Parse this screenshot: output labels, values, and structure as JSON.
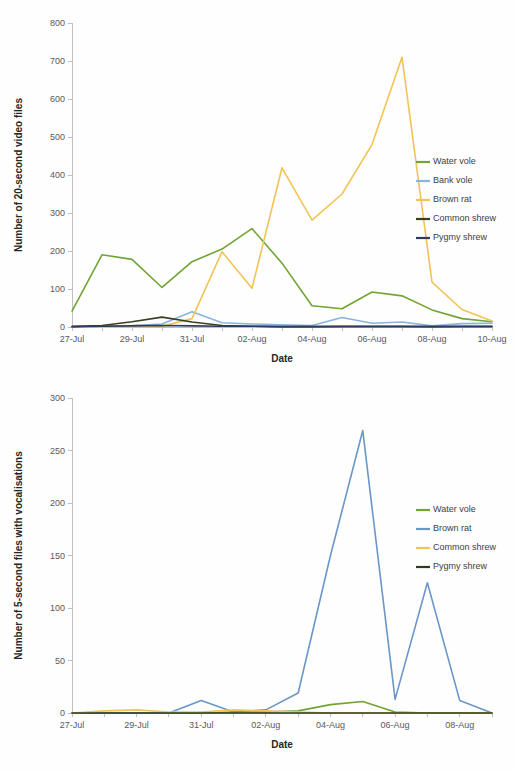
{
  "figure": {
    "title": "",
    "background": "#fefefe"
  },
  "palette": {
    "water_vole": "#70A433",
    "bank_vole": "#89B4DE",
    "brown_rat_gold": "#F2C357",
    "common_shrew_dark": "#3A3F1C",
    "pygmy_shrew_navy": "#2F3B5C",
    "brown_rat_blue": "#6A96C8",
    "common_shrew_gold": "#F2C357",
    "pygmy_shrew_dark": "#2E3B20",
    "axis": "#bfbfbf",
    "text": "#404040"
  },
  "chart_data": [
    {
      "id": "video-files-chart",
      "type": "line",
      "title": "",
      "xlabel": "Date",
      "ylabel": "Number of 20-second video files",
      "ylim": [
        0,
        800
      ],
      "yticks": [
        0,
        100,
        200,
        300,
        400,
        500,
        600,
        700,
        800
      ],
      "ytick_labels": [
        "0",
        "100",
        "200",
        "300",
        "400",
        "500",
        "600",
        "700",
        "800"
      ],
      "grid": false,
      "legend_position": "right",
      "x": [
        "27-Jul",
        "28-Jul",
        "29-Jul",
        "30-Jul",
        "31-Jul",
        "01-Aug",
        "02-Aug",
        "03-Aug",
        "04-Aug",
        "05-Aug",
        "06-Aug",
        "07-Aug",
        "08-Aug",
        "09-Aug",
        "10-Aug"
      ],
      "xtick_labels": [
        "27-Jul",
        "",
        "29-Jul",
        "",
        "31-Jul",
        "",
        "02-Aug",
        "",
        "04-Aug",
        "",
        "06-Aug",
        "",
        "08-Aug",
        "",
        "10-Aug"
      ],
      "series": [
        {
          "name": "Water vole",
          "color_key": "water_vole",
          "values": [
            42,
            190,
            178,
            104,
            172,
            205,
            259,
            168,
            56,
            48,
            92,
            82,
            45,
            22,
            14
          ]
        },
        {
          "name": "Bank vole",
          "color_key": "bank_vole",
          "values": [
            2,
            3,
            4,
            8,
            40,
            11,
            8,
            6,
            4,
            25,
            10,
            13,
            3,
            9,
            10
          ]
        },
        {
          "name": "Brown rat",
          "color_key": "brown_rat_gold",
          "values": [
            0,
            0,
            0,
            2,
            22,
            198,
            102,
            419,
            281,
            350,
            480,
            710,
            118,
            46,
            16
          ]
        },
        {
          "name": "Common shrew",
          "color_key": "common_shrew_dark",
          "values": [
            1,
            4,
            14,
            26,
            13,
            4,
            2,
            1,
            1,
            1,
            1,
            1,
            1,
            1,
            1
          ]
        },
        {
          "name": "Pygmy shrew",
          "color_key": "pygmy_shrew_navy",
          "values": [
            1,
            2,
            3,
            4,
            3,
            2,
            2,
            1,
            1,
            2,
            2,
            2,
            1,
            2,
            2
          ]
        }
      ]
    },
    {
      "id": "vocalisation-files-chart",
      "type": "line",
      "title": "",
      "xlabel": "Date",
      "ylabel": "Number of 5-second files with vocalisations",
      "ylim": [
        0,
        300
      ],
      "yticks": [
        0,
        50,
        100,
        150,
        200,
        250,
        300
      ],
      "ytick_labels": [
        "0",
        "50",
        "100",
        "150",
        "200",
        "250",
        "300"
      ],
      "grid": false,
      "legend_position": "right",
      "x": [
        "27-Jul",
        "28-Jul",
        "29-Jul",
        "30-Jul",
        "31-Jul",
        "01-Aug",
        "02-Aug",
        "03-Aug",
        "04-Aug",
        "05-Aug",
        "06-Aug",
        "07-Aug",
        "08-Aug",
        "09-Aug"
      ],
      "xtick_labels": [
        "27-Jul",
        "",
        "29-Jul",
        "",
        "31-Jul",
        "",
        "02-Aug",
        "",
        "04-Aug",
        "",
        "06-Aug",
        "",
        "08-Aug",
        ""
      ],
      "series": [
        {
          "name": "Water vole",
          "color_key": "water_vole",
          "values": [
            0,
            0,
            0,
            0,
            0,
            1,
            1,
            2,
            8,
            11,
            1,
            0,
            0,
            0
          ]
        },
        {
          "name": "Brown rat",
          "color_key": "brown_rat_blue",
          "values": [
            0,
            0,
            0,
            0,
            12,
            1,
            3,
            19,
            150,
            269,
            13,
            124,
            12,
            0
          ]
        },
        {
          "name": "Common shrew",
          "color_key": "common_shrew_gold",
          "values": [
            0,
            2,
            3,
            1,
            1,
            3,
            2,
            1,
            0,
            0,
            0,
            0,
            0,
            0
          ]
        },
        {
          "name": "Pygmy shrew",
          "color_key": "pygmy_shrew_dark",
          "values": [
            0,
            0,
            0,
            0,
            0,
            0,
            0,
            0,
            0,
            0,
            0,
            0,
            0,
            0
          ]
        }
      ]
    }
  ]
}
